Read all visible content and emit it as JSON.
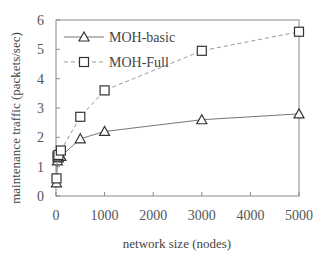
{
  "chart_data": {
    "type": "line",
    "title": "",
    "xlabel": "network size (nodes)",
    "ylabel": "maintenance traffic (packets/sec)",
    "xlim": [
      0,
      5000
    ],
    "ylim": [
      0,
      6
    ],
    "xticks": [
      0,
      1000,
      2000,
      3000,
      4000,
      5000
    ],
    "yticks": [
      0,
      1,
      2,
      3,
      4,
      5,
      6
    ],
    "grid": false,
    "legend_position": "upper left",
    "series": [
      {
        "name": "MOH-basic",
        "marker": "triangle",
        "line_style": "solid",
        "x": [
          10,
          30,
          50,
          100,
          500,
          1000,
          3000,
          5000
        ],
        "y": [
          0.45,
          1.2,
          1.3,
          1.35,
          1.95,
          2.2,
          2.6,
          2.8
        ]
      },
      {
        "name": "MOH-Full",
        "marker": "square",
        "line_style": "dashed",
        "x": [
          10,
          30,
          50,
          100,
          500,
          1000,
          3000,
          5000
        ],
        "y": [
          0.6,
          1.35,
          1.4,
          1.55,
          2.7,
          3.6,
          4.95,
          5.6
        ]
      }
    ]
  },
  "colors": {
    "axis": "#888888",
    "basic_line": "#777777",
    "full_line": "#999999",
    "marker": "#333333"
  }
}
